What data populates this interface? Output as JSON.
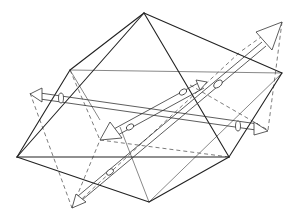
{
  "figure": {
    "title": "",
    "description_visible": "",
    "shape": "octahedron",
    "vertices": {
      "top": [
        144,
        13
      ],
      "left": [
        17,
        157
      ],
      "bottom": [
        149,
        202
      ],
      "front_right": [
        229,
        157
      ],
      "right": [
        282,
        73
      ],
      "back_left": [
        70,
        70
      ]
    },
    "colors": {
      "line": "#222222",
      "background": "#ffffff"
    },
    "axes": [
      {
        "name": "diagonal-axis-long",
        "from": [
          70,
          198
        ],
        "to": [
          282,
          22
        ]
      },
      {
        "name": "horizontal-axis",
        "from": [
          30,
          93
        ],
        "to": [
          268,
          130
        ]
      },
      {
        "name": "diagonal-axis-short",
        "from": [
          100,
          140
        ],
        "to": [
          205,
          80
        ]
      }
    ]
  }
}
